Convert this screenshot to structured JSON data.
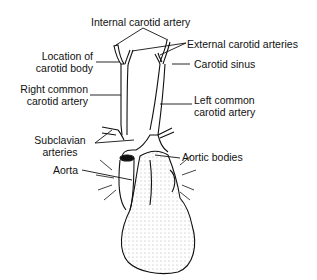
{
  "diagram": {
    "type": "anatomical illustration",
    "labels": {
      "internal_carotid": "Internal carotid artery",
      "external_carotid": "External carotid arteries",
      "carotid_body_1": "Location of",
      "carotid_body_2": "carotid body",
      "carotid_sinus": "Carotid sinus",
      "right_common_1": "Right common",
      "right_common_2": "carotid artery",
      "left_common_1": "Left common",
      "left_common_2": "carotid artery",
      "subclavian_1": "Subclavian",
      "subclavian_2": "arteries",
      "aortic_bodies": "Aortic bodies",
      "aorta": "Aorta"
    }
  }
}
